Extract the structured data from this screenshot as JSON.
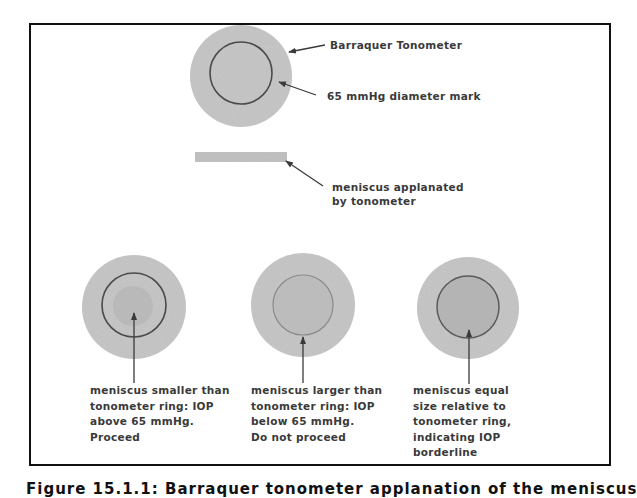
{
  "figure": {
    "caption": "Figure 15.1.1: Barraquer tonometer applanation of the meniscus",
    "colors": {
      "frame": "#111111",
      "tonometer_disc": "#c4c4c4",
      "meniscus_fill": "#b5b5b5",
      "ring_stroke": "#4a4a4a",
      "arrow": "#3a3a3a",
      "text": "#3a3a3a"
    }
  },
  "top_diagram": {
    "labels": {
      "tonometer": "Barraquer Tonometer",
      "diameter_mark": "65 mmHg diameter mark"
    }
  },
  "applanation": {
    "label_lines": [
      "meniscus applanated",
      "by tonometer"
    ]
  },
  "cases": [
    {
      "id": "smaller",
      "caption_lines": [
        "meniscus smaller than",
        "tonometer ring: IOP",
        "above 65 mmHg.",
        "Proceed"
      ]
    },
    {
      "id": "larger",
      "caption_lines": [
        "meniscus larger than",
        "tonometer ring: IOP",
        "below 65 mmHg.",
        "Do not proceed"
      ]
    },
    {
      "id": "equal",
      "caption_lines": [
        "meniscus equal",
        "size relative to",
        "tonometer ring,",
        "indicating IOP",
        "borderline"
      ]
    }
  ]
}
